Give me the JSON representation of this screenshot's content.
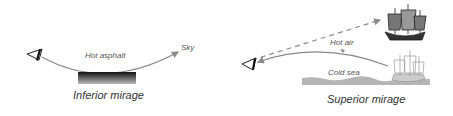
{
  "inferior": {
    "medium_label": "Hot asphalt",
    "target_label": "Sky",
    "caption": "Inferior mirage"
  },
  "superior": {
    "medium_label": "Hot air",
    "surface_label": "Cold sea",
    "caption": "Superior mirage"
  },
  "colors": {
    "ray": "#8a8a8a",
    "sea": "#b5b5b5",
    "asphalt": "#1a1a1a"
  }
}
